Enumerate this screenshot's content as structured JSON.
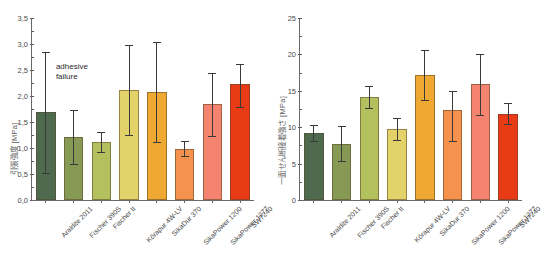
{
  "figure": {
    "background": "#ffffff",
    "caption_fragment": "",
    "categories": [
      "Araldite 2011",
      "Fischer 390S",
      "Fischer II",
      "Körapur 4W-LV",
      "SikaDur 370",
      "SikaPower 1200",
      "SikaPower 1277",
      "SW7240"
    ],
    "palette": [
      "#4f6b4f",
      "#879a55",
      "#b2c05e",
      "#e3d169",
      "#efa832",
      "#f5924e",
      "#f4836f",
      "#ea3b17"
    ]
  },
  "chart_data": [
    {
      "type": "bar",
      "panel": "left",
      "title": "",
      "xlabel": "",
      "ylabel": "引張強度 [MPa]",
      "ylim": [
        0.0,
        3.5
      ],
      "yticks": [
        "0,0",
        "0,5",
        "1,0",
        "1,5",
        "2,0",
        "2,5",
        "3,0",
        "3,5"
      ],
      "ytick_values": [
        0.0,
        0.5,
        1.0,
        1.5,
        2.0,
        2.5,
        3.0,
        3.5
      ],
      "grid": false,
      "legend": "none",
      "categories": [
        "Araldite 2011",
        "Fischer 390S",
        "Fischer II",
        "Körapur 4W-LV",
        "SikaDur 370",
        "SikaPower 1200",
        "SikaPower 1277",
        "SW7240"
      ],
      "values": [
        1.69,
        1.22,
        1.12,
        2.12,
        2.08,
        0.99,
        1.84,
        2.24
      ],
      "err_low": [
        0.52,
        0.69,
        0.92,
        1.25,
        1.12,
        0.85,
        1.24,
        1.78
      ],
      "err_high": [
        2.85,
        1.73,
        1.31,
        2.99,
        3.03,
        1.14,
        2.44,
        2.62
      ],
      "hatched_bars": [
        0
      ],
      "annotations": [
        {
          "text": "adhesive\nfailure",
          "x_category": "Araldite 2011",
          "y_value": 2.65
        }
      ]
    },
    {
      "type": "bar",
      "panel": "right",
      "title": "",
      "xlabel": "",
      "ylabel": "一面せん断接着強さ [MPa]",
      "ylim": [
        0,
        25
      ],
      "yticks": [
        "0",
        "5",
        "10",
        "15",
        "20",
        "25"
      ],
      "ytick_values": [
        0,
        5,
        10,
        15,
        20,
        25
      ],
      "grid": false,
      "legend": "none",
      "categories": [
        "Araldite 2011",
        "Fischer 390S",
        "Fischer II",
        "Körapur 4W-LV",
        "SikaDur 370",
        "SikaPower 1200",
        "SikaPower 1277",
        "SW7240"
      ],
      "values": [
        9.2,
        7.7,
        14.2,
        9.7,
        17.2,
        12.4,
        15.9,
        11.8
      ],
      "err_low": [
        8.1,
        5.4,
        12.6,
        8.3,
        13.7,
        8.1,
        11.7,
        10.4
      ],
      "err_high": [
        10.3,
        10.2,
        15.7,
        11.2,
        20.6,
        15.0,
        20.1,
        13.3
      ],
      "hatched_bars": [],
      "annotations": []
    }
  ]
}
